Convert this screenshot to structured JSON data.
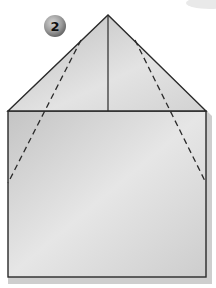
{
  "diagram": {
    "type": "origami-fold-step",
    "step_badge": {
      "label": "2",
      "cx": 55,
      "cy": 26,
      "r": 11
    },
    "colors": {
      "background": "#ffffff",
      "paper_light": "#e2e2e2",
      "paper_dark": "#b9b9b9",
      "outline": "#2a2a2a",
      "shadow": "#9a9a9a",
      "badge_light": "#c9c9c9",
      "badge_dark": "#6f6f6f",
      "badge_text": "#111111"
    },
    "shape": {
      "apex": [
        108,
        15
      ],
      "square_top_left": [
        8,
        111
      ],
      "square_top_right": [
        206,
        111
      ],
      "square_bottom_left": [
        8,
        277
      ],
      "square_bottom_right": [
        206,
        277
      ]
    },
    "lines": {
      "center_fold": {
        "from": [
          108,
          15
        ],
        "to": [
          108,
          111
        ],
        "style": "solid"
      },
      "left_fold": {
        "from": [
          81,
          40
        ],
        "to": [
          8,
          183
        ],
        "style": "dashed"
      },
      "right_fold": {
        "from": [
          135,
          40
        ],
        "to": [
          206,
          183
        ],
        "style": "dashed"
      }
    }
  }
}
